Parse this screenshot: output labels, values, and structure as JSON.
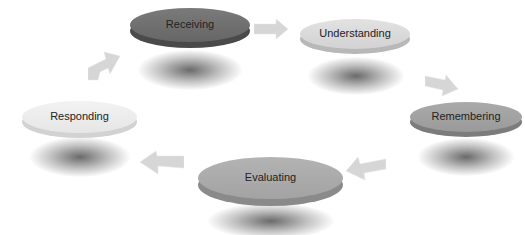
{
  "diagram": {
    "type": "cycle",
    "title": "",
    "nodes": [
      {
        "id": "receiving",
        "label": "Receiving",
        "top_color": "#707070",
        "side_color": "#4a4a4a"
      },
      {
        "id": "understanding",
        "label": "Understanding",
        "top_color": "#dadada",
        "side_color": "#b8b8b8"
      },
      {
        "id": "remembering",
        "label": "Remembering",
        "top_color": "#a2a2a2",
        "side_color": "#7c7c7c"
      },
      {
        "id": "evaluating",
        "label": "Evaluating",
        "top_color": "#ababab",
        "side_color": "#8a8a8a"
      },
      {
        "id": "responding",
        "label": "Responding",
        "top_color": "#ececec",
        "side_color": "#d2d2d2"
      }
    ],
    "edges": [
      {
        "from": "receiving",
        "to": "understanding"
      },
      {
        "from": "understanding",
        "to": "remembering"
      },
      {
        "from": "remembering",
        "to": "evaluating"
      },
      {
        "from": "evaluating",
        "to": "responding"
      },
      {
        "from": "responding",
        "to": "receiving"
      }
    ],
    "arrow_color": "#d4d4d4"
  }
}
